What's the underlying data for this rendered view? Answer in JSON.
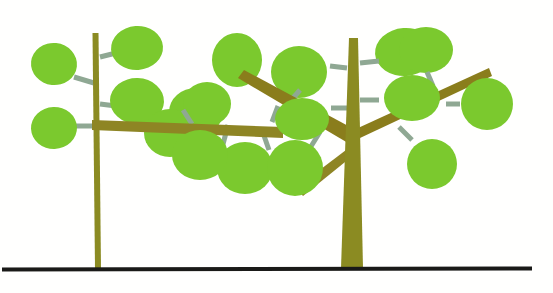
{
  "canvas": {
    "width": 553,
    "height": 293,
    "background_color": "#FFFFFE",
    "title": "Two stylized trees on a ground line"
  },
  "palette": {
    "leaf_green": "#7BC92E",
    "leaf_green_alt": "#78C62C",
    "trunk_olive": "#8B8B22",
    "branch_olive_dark": "#8A7D1C",
    "branch_olive_mid": "#8E8524",
    "stem_grey_green": "#8FA893",
    "ground_black": "#1A1A18"
  },
  "ground": {
    "label": "ground-line",
    "x1": 2,
    "y1": 269.5,
    "x2": 532,
    "y2": 268.5,
    "thickness": 4,
    "color": "#1A1A18"
  },
  "trees": [
    {
      "id": "left-tree",
      "label": "Left sapling",
      "trunk": {
        "label": "left-trunk",
        "points": "92.5,33 98.5,33 101,268 95,268",
        "color": "#8B8B22"
      },
      "branches": [],
      "stems": [
        {
          "label": "stem-l1",
          "x1": 100,
          "y1": 57,
          "x2": 116,
          "y2": 53,
          "width": 5,
          "color": "#8FA893"
        },
        {
          "label": "stem-l2",
          "x1": 94,
          "y1": 83,
          "x2": 74,
          "y2": 77,
          "width": 5,
          "color": "#8FA893"
        },
        {
          "label": "stem-l3",
          "x1": 100,
          "y1": 104,
          "x2": 116,
          "y2": 106,
          "width": 5,
          "color": "#8FA893"
        },
        {
          "label": "stem-l4",
          "x1": 94,
          "y1": 126,
          "x2": 73,
          "y2": 126,
          "width": 5,
          "color": "#8FA893"
        }
      ],
      "leaves": [
        {
          "label": "leaf-l1",
          "cx": 137,
          "cy": 48,
          "rx": 26,
          "ry": 22,
          "rot": -4,
          "color": "#7BC92E"
        },
        {
          "label": "leaf-l2",
          "cx": 54,
          "cy": 64,
          "rx": 23,
          "ry": 21,
          "rot": 6,
          "color": "#7BC92E"
        },
        {
          "label": "leaf-l3",
          "cx": 137,
          "cy": 101,
          "rx": 27,
          "ry": 23,
          "rot": 2,
          "color": "#7BC92E"
        },
        {
          "label": "leaf-l4",
          "cx": 54,
          "cy": 128,
          "rx": 23,
          "ry": 21,
          "rot": -2,
          "color": "#7BC92E"
        }
      ]
    },
    {
      "id": "right-tree",
      "label": "Right tree",
      "trunk": {
        "label": "right-trunk",
        "points": "349,38 358,38 363,268 341,268",
        "color": "#8B8B22"
      },
      "branches": [
        {
          "label": "branch-upper-left-main",
          "points": "352,128 244,70 238,78 348,143",
          "color": "#8A7D1C"
        },
        {
          "label": "branch-lower-left-fork",
          "points": "350,158 303,196 296,188 346,150",
          "color": "#8E8524"
        },
        {
          "label": "branch-horizontal-left",
          "points": "283,127 92,120 92,130 283,138",
          "color": "#8E8524"
        },
        {
          "label": "branch-upper-right",
          "points": "358,128 489,68 492,76 360,138",
          "color": "#8A7D1C"
        }
      ],
      "stems": [
        {
          "label": "stem-r1",
          "x1": 360,
          "y1": 63,
          "x2": 379,
          "y2": 61,
          "width": 5,
          "color": "#8FA893"
        },
        {
          "label": "stem-r2",
          "x1": 360,
          "y1": 100,
          "x2": 379,
          "y2": 100,
          "width": 5,
          "color": "#8FA893"
        },
        {
          "label": "stem-r3",
          "x1": 347,
          "y1": 68,
          "x2": 330,
          "y2": 66,
          "width": 5,
          "color": "#8FA893"
        },
        {
          "label": "stem-r4",
          "x1": 347,
          "y1": 108,
          "x2": 331,
          "y2": 108,
          "width": 5,
          "color": "#8FA893"
        },
        {
          "label": "stem-r5",
          "x1": 399,
          "y1": 127,
          "x2": 412,
          "y2": 140,
          "width": 5,
          "color": "#8FA893"
        },
        {
          "label": "stem-r6",
          "x1": 446,
          "y1": 104,
          "x2": 460,
          "y2": 104,
          "width": 5,
          "color": "#8FA893"
        },
        {
          "label": "stem-r7",
          "x1": 433,
          "y1": 86,
          "x2": 427,
          "y2": 72,
          "width": 5,
          "color": "#8FA893"
        },
        {
          "label": "stem-b1",
          "x1": 300,
          "y1": 90,
          "x2": 287,
          "y2": 105,
          "width": 5,
          "color": "#8FA893"
        },
        {
          "label": "stem-b2",
          "x1": 278,
          "y1": 106,
          "x2": 272,
          "y2": 122,
          "width": 5,
          "color": "#8FA893"
        },
        {
          "label": "stem-b3",
          "x1": 262,
          "y1": 130,
          "x2": 269,
          "y2": 150,
          "width": 5,
          "color": "#8FA893"
        },
        {
          "label": "stem-b4",
          "x1": 320,
          "y1": 132,
          "x2": 310,
          "y2": 148,
          "width": 5,
          "color": "#8FA893"
        },
        {
          "label": "stem-b5",
          "x1": 228,
          "y1": 125,
          "x2": 222,
          "y2": 148,
          "width": 5,
          "color": "#8FA893"
        },
        {
          "label": "stem-b6",
          "x1": 192,
          "y1": 124,
          "x2": 183,
          "y2": 110,
          "width": 5,
          "color": "#8FA893"
        }
      ],
      "leaves": [
        {
          "label": "leaf-r1",
          "cx": 405,
          "cy": 52,
          "rx": 30,
          "ry": 24,
          "rot": -4,
          "color": "#7BC92E"
        },
        {
          "label": "leaf-r2",
          "cx": 412,
          "cy": 98,
          "rx": 28,
          "ry": 23,
          "rot": 0,
          "color": "#7BC92E"
        },
        {
          "label": "leaf-r3",
          "cx": 299,
          "cy": 72,
          "rx": 28,
          "ry": 26,
          "rot": 0,
          "color": "#7BC92E"
        },
        {
          "label": "leaf-r4",
          "cx": 302,
          "cy": 119,
          "rx": 27,
          "ry": 21,
          "rot": 0,
          "color": "#7BC92E"
        },
        {
          "label": "leaf-r5",
          "cx": 432,
          "cy": 164,
          "rx": 25,
          "ry": 25,
          "rot": 0,
          "color": "#7BC92E"
        },
        {
          "label": "leaf-r6",
          "cx": 487,
          "cy": 104,
          "rx": 26,
          "ry": 26,
          "rot": 0,
          "color": "#7BC92E"
        },
        {
          "label": "leaf-r7",
          "cx": 426,
          "cy": 50,
          "rx": 27,
          "ry": 23,
          "rot": 0,
          "color": "#7BC92E"
        },
        {
          "label": "leaf-b1",
          "cx": 237,
          "cy": 60,
          "rx": 25,
          "ry": 27,
          "rot": 0,
          "color": "#7BC92E"
        },
        {
          "label": "leaf-b2",
          "cx": 196,
          "cy": 112,
          "rx": 27,
          "ry": 24,
          "rot": 0,
          "color": "#7BC92E"
        },
        {
          "label": "leaf-b3",
          "cx": 245,
          "cy": 168,
          "rx": 28,
          "ry": 26,
          "rot": 0,
          "color": "#7BC92E"
        },
        {
          "label": "leaf-b4",
          "cx": 295,
          "cy": 168,
          "rx": 28,
          "ry": 28,
          "rot": 0,
          "color": "#7BC92E"
        },
        {
          "label": "leaf-b5",
          "cx": 200,
          "cy": 155,
          "rx": 28,
          "ry": 25,
          "rot": 0,
          "color": "#7BC92E"
        },
        {
          "label": "leaf-b6",
          "cx": 170,
          "cy": 133,
          "rx": 26,
          "ry": 24,
          "rot": 0,
          "color": "#7BC92E"
        },
        {
          "label": "leaf-b7",
          "cx": 207,
          "cy": 104,
          "rx": 24,
          "ry": 22,
          "rot": 0,
          "color": "#7BC92E"
        }
      ]
    }
  ]
}
